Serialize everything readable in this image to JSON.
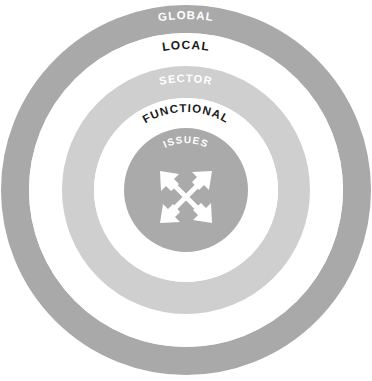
{
  "diagram": {
    "type": "concentric-rings",
    "title": "",
    "background_color": "#ffffff",
    "center": {
      "x": 186,
      "y": 190
    },
    "rings": [
      {
        "label": "GLOBAL",
        "level": 1,
        "position": "outermost",
        "fill_color": "#a9a9a9",
        "text_color": "#ffffff",
        "outer_radius": 185,
        "inner_radius": 157,
        "label_radius": 171,
        "font_size": 11.5
      },
      {
        "label": "LOCAL",
        "level": 2,
        "position": "second",
        "fill_color": "#ffffff",
        "text_color": "#1a1a1a",
        "outer_radius": 157,
        "inner_radius": 124,
        "label_radius": 141,
        "font_size": 12
      },
      {
        "label": "SECTOR",
        "level": 3,
        "position": "third",
        "fill_color": "#cfcfcf",
        "text_color": "#ffffff",
        "outer_radius": 124,
        "inner_radius": 92,
        "label_radius": 108,
        "font_size": 11
      },
      {
        "label": "FUNCTIONAL",
        "level": 4,
        "position": "fourth",
        "fill_color": "#ffffff",
        "text_color": "#1a1a1a",
        "outer_radius": 92,
        "inner_radius": 62,
        "label_radius": 78,
        "font_size": 11.5
      },
      {
        "label": "ISSUES",
        "level": 5,
        "position": "center",
        "fill_color": "#aaaaaa",
        "text_color": "#ffffff",
        "outer_radius": 62,
        "inner_radius": 0,
        "label_radius": 47,
        "font_size": 10
      }
    ],
    "center_icon": {
      "name": "four-way-expand-arrows-icon",
      "color": "#ffffff",
      "size": 56
    }
  }
}
